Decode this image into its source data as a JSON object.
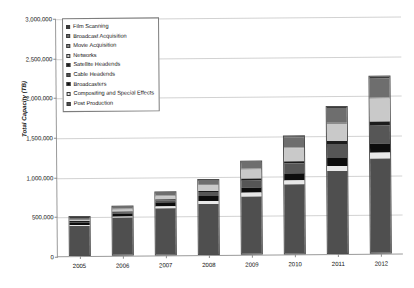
{
  "chart_data": {
    "type": "bar",
    "stacked": true,
    "title": "",
    "xlabel": "",
    "ylabel": "Total Capacity (TB)",
    "ylim": [
      0,
      3000000
    ],
    "ytick_values": [
      0,
      500000,
      1000000,
      1500000,
      2000000,
      2500000,
      3000000
    ],
    "ytick_labels": [
      "0",
      "500,000",
      "1,000,000",
      "1,500,000",
      "2,000,000",
      "2,500,000",
      "3,000,000"
    ],
    "grid": true,
    "legend_position": "upper left",
    "categories": [
      "2005",
      "2006",
      "2007",
      "2008",
      "2009",
      "2010",
      "2011",
      "2012"
    ],
    "series": [
      {
        "name": "Post Production",
        "color": "#4f4f4f",
        "values": [
          380000,
          480000,
          600000,
          650000,
          730000,
          880000,
          1050000,
          1200000
        ]
      },
      {
        "name": "Compositing and Special Effects",
        "color": "#e8e8e8",
        "values": [
          20000,
          25000,
          30000,
          40000,
          50000,
          55000,
          60000,
          70000
        ]
      },
      {
        "name": "Broadcasters",
        "color": "#0d0d0d",
        "values": [
          25000,
          30000,
          40000,
          55000,
          70000,
          85000,
          100000,
          120000
        ]
      },
      {
        "name": "Cable Headends",
        "color": "#565656",
        "values": [
          15000,
          20000,
          30000,
          55000,
          90000,
          130000,
          180000,
          230000
        ]
      },
      {
        "name": "Satellite Headends",
        "color": "#1c1c1c",
        "values": [
          8000,
          10000,
          15000,
          20000,
          28000,
          35000,
          42000,
          50000
        ]
      },
      {
        "name": "Networks",
        "color": "#c9c9c9",
        "values": [
          22000,
          30000,
          45000,
          70000,
          110000,
          160000,
          220000,
          290000
        ]
      },
      {
        "name": "Movie Acquisition",
        "color": "#8c8c8c",
        "values": [
          5000,
          6000,
          8000,
          10000,
          12000,
          15000,
          18000,
          22000
        ]
      },
      {
        "name": "Broadcast Acquisition",
        "color": "#6e6e6e",
        "values": [
          20000,
          25000,
          35000,
          55000,
          90000,
          130000,
          180000,
          240000
        ]
      },
      {
        "name": "Film Scanning",
        "color": "#3c3c3c",
        "values": [
          5000,
          6000,
          7000,
          8000,
          10000,
          12000,
          14000,
          16000
        ]
      }
    ],
    "legend_order": [
      "Film Scanning",
      "Broadcast Acquisition",
      "Movie Acquisition",
      "Networks",
      "Satellite Headends",
      "Cable Headends",
      "Broadcasters",
      "Compositing and Special Effects",
      "Post Production"
    ],
    "totals": [
      500000,
      632000,
      810000,
      963000,
      1190000,
      1502000,
      1864000,
      2238000
    ]
  }
}
